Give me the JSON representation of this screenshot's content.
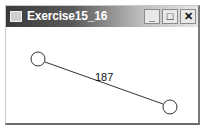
{
  "window": {
    "title": "Exercise15_16",
    "controls": {
      "minimize": "_",
      "maximize": "□",
      "close": "✕"
    }
  },
  "canvas": {
    "circles": [
      {
        "cx": 32,
        "cy": 32,
        "r": 7
      },
      {
        "cx": 164,
        "cy": 80,
        "r": 7
      }
    ],
    "line": {
      "x1": 39,
      "y1": 35,
      "x2": 157,
      "y2": 77
    },
    "distance_label": "187",
    "stroke_color": "#333333"
  }
}
